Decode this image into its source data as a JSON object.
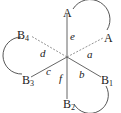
{
  "diagram": {
    "center": {
      "x": 67,
      "y": 57
    },
    "points": {
      "A_top": {
        "label": "A",
        "x": 67,
        "y": 12
      },
      "A_right": {
        "label": "A",
        "x": 108,
        "y": 37
      },
      "B1": {
        "label": "B",
        "sub": "1",
        "x": 105,
        "y": 79
      },
      "B2": {
        "label": "B",
        "sub": "2",
        "x": 67,
        "y": 103
      },
      "B3": {
        "label": "B",
        "sub": "3",
        "x": 26,
        "y": 79
      },
      "B4": {
        "label": "B",
        "sub": "4",
        "x": 26,
        "y": 34
      }
    },
    "edge_labels": {
      "a": "a",
      "b": "b",
      "c": "c",
      "d": "d",
      "e": "e",
      "f": "f"
    },
    "line_color": "#555555",
    "arc_color": "#444444"
  }
}
